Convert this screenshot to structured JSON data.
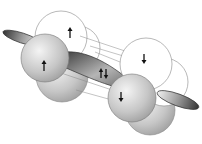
{
  "diagram": {
    "type": "orbital-overlap",
    "colors": {
      "background": "#ffffff",
      "outline": "#555555",
      "sphere_shade": "#b8b8b8",
      "ellipse_dark": "#3a3a3a",
      "arrow": "#111111"
    },
    "left_atom": {
      "front_spin": "up",
      "back_spin": "up"
    },
    "right_atom": {
      "front_spin": "down",
      "back_spin": "down"
    },
    "bond_region": {
      "spins": [
        "up",
        "down"
      ],
      "label": "↑↓"
    }
  }
}
